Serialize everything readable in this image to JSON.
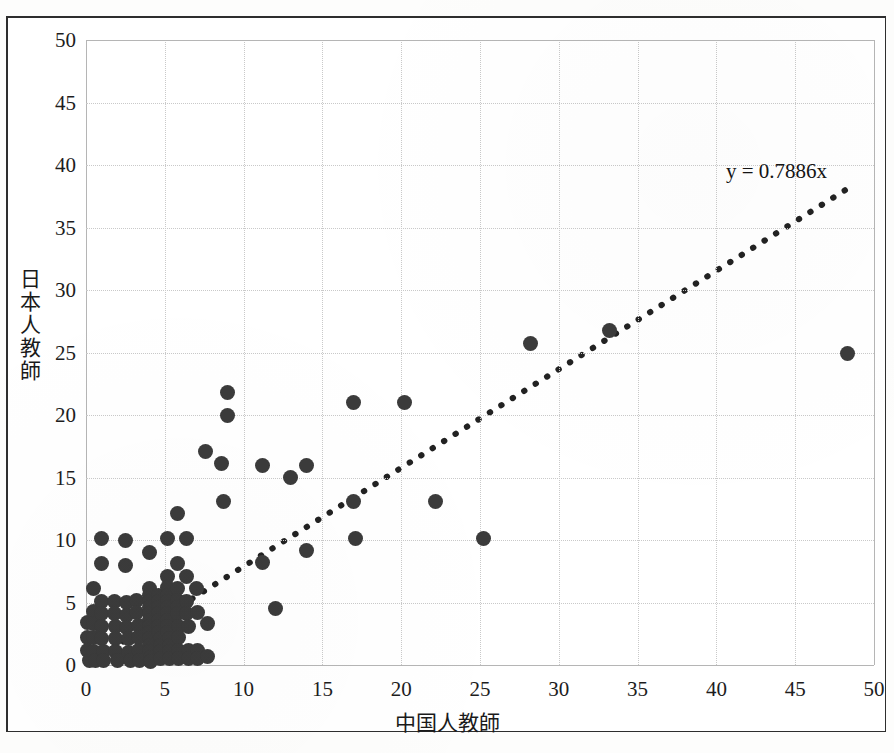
{
  "chart_data": {
    "type": "scatter",
    "title": "",
    "xlabel": "中国人教師",
    "ylabel": "日本人教師",
    "xlim": [
      0,
      50
    ],
    "ylim": [
      0,
      50
    ],
    "xticks": [
      0,
      5,
      10,
      15,
      20,
      25,
      30,
      35,
      40,
      45,
      50
    ],
    "yticks": [
      0,
      5,
      10,
      15,
      20,
      25,
      30,
      35,
      40,
      45,
      50
    ],
    "grid": true,
    "legend": null,
    "marker_color": "#3b3b3b",
    "annotations": [
      {
        "text": "y = 0.7886x",
        "x": 40.6,
        "y": 40.5,
        "name": "regression-equation"
      }
    ],
    "trendline": {
      "type": "linear-through-origin",
      "equation": "y = 0.7886x",
      "slope": 0.7886,
      "intercept": 0,
      "style": "dotted",
      "x_start": 0.2,
      "x_end": 48.5,
      "color": "#222222"
    },
    "points": [
      [
        0.1,
        3.4
      ],
      [
        0.1,
        2.2
      ],
      [
        0.1,
        1.2
      ],
      [
        0.2,
        0.4
      ],
      [
        0.5,
        6.1
      ],
      [
        0.5,
        4.3
      ],
      [
        0.5,
        3.3
      ],
      [
        0.5,
        2.2
      ],
      [
        0.5,
        1.1
      ],
      [
        0.6,
        0.4
      ],
      [
        1.0,
        10.1
      ],
      [
        1.0,
        8.1
      ],
      [
        1.0,
        5.1
      ],
      [
        1.0,
        4.1
      ],
      [
        1.0,
        3.1
      ],
      [
        1.0,
        2.1
      ],
      [
        1.1,
        1.1
      ],
      [
        1.1,
        0.4
      ],
      [
        1.8,
        5.1
      ],
      [
        1.8,
        4.1
      ],
      [
        1.9,
        3.1
      ],
      [
        1.9,
        2.1
      ],
      [
        1.9,
        1.1
      ],
      [
        2.0,
        0.4
      ],
      [
        2.5,
        10.0
      ],
      [
        2.5,
        8.0
      ],
      [
        2.6,
        5.0
      ],
      [
        2.6,
        4.0
      ],
      [
        2.6,
        3.0
      ],
      [
        2.7,
        2.1
      ],
      [
        2.7,
        1.0
      ],
      [
        2.8,
        0.4
      ],
      [
        3.2,
        5.2
      ],
      [
        3.2,
        4.2
      ],
      [
        3.3,
        3.2
      ],
      [
        3.3,
        2.2
      ],
      [
        3.3,
        1.2
      ],
      [
        3.4,
        0.4
      ],
      [
        4.0,
        9.0
      ],
      [
        4.0,
        6.1
      ],
      [
        4.0,
        5.6
      ],
      [
        4.0,
        5.1
      ],
      [
        4.0,
        4.6
      ],
      [
        4.0,
        4.1
      ],
      [
        4.0,
        3.6
      ],
      [
        4.0,
        3.1
      ],
      [
        4.0,
        2.6
      ],
      [
        4.0,
        2.1
      ],
      [
        4.0,
        1.6
      ],
      [
        4.0,
        1.1
      ],
      [
        4.1,
        0.6
      ],
      [
        4.1,
        0.3
      ],
      [
        4.6,
        5.6
      ],
      [
        4.6,
        5.1
      ],
      [
        4.6,
        4.6
      ],
      [
        4.6,
        4.1
      ],
      [
        4.6,
        3.6
      ],
      [
        4.6,
        3.1
      ],
      [
        4.6,
        2.6
      ],
      [
        4.7,
        2.1
      ],
      [
        4.7,
        1.6
      ],
      [
        4.7,
        1.1
      ],
      [
        4.7,
        0.5
      ],
      [
        5.2,
        10.1
      ],
      [
        5.2,
        7.1
      ],
      [
        5.2,
        6.2
      ],
      [
        5.2,
        5.6
      ],
      [
        5.2,
        5.1
      ],
      [
        5.2,
        4.6
      ],
      [
        5.2,
        4.1
      ],
      [
        5.2,
        3.6
      ],
      [
        5.2,
        3.1
      ],
      [
        5.2,
        2.6
      ],
      [
        5.3,
        2.1
      ],
      [
        5.3,
        1.6
      ],
      [
        5.3,
        1.1
      ],
      [
        5.3,
        0.5
      ],
      [
        5.8,
        12.1
      ],
      [
        5.8,
        8.1
      ],
      [
        5.8,
        6.1
      ],
      [
        5.8,
        5.2
      ],
      [
        5.8,
        4.6
      ],
      [
        5.8,
        4.1
      ],
      [
        5.9,
        3.1
      ],
      [
        5.9,
        2.2
      ],
      [
        5.9,
        1.2
      ],
      [
        5.9,
        0.5
      ],
      [
        6.4,
        10.1
      ],
      [
        6.4,
        7.1
      ],
      [
        6.4,
        5.1
      ],
      [
        6.4,
        4.1
      ],
      [
        6.5,
        3.1
      ],
      [
        6.5,
        1.2
      ],
      [
        6.5,
        0.5
      ],
      [
        7.0,
        6.1
      ],
      [
        7.1,
        4.2
      ],
      [
        7.1,
        1.2
      ],
      [
        7.1,
        0.5
      ],
      [
        7.6,
        17.1
      ],
      [
        7.7,
        3.3
      ],
      [
        7.7,
        0.7
      ],
      [
        8.6,
        16.1
      ],
      [
        8.7,
        13.1
      ],
      [
        9.0,
        21.8
      ],
      [
        9.0,
        20.0
      ],
      [
        11.2,
        16.0
      ],
      [
        11.2,
        8.2
      ],
      [
        12.0,
        4.5
      ],
      [
        13.0,
        15.0
      ],
      [
        14.0,
        16.0
      ],
      [
        14.0,
        9.2
      ],
      [
        17.0,
        21.0
      ],
      [
        17.0,
        13.1
      ],
      [
        17.1,
        10.1
      ],
      [
        20.2,
        21.0
      ],
      [
        22.2,
        13.1
      ],
      [
        25.2,
        10.1
      ],
      [
        28.2,
        25.7
      ],
      [
        33.2,
        26.8
      ],
      [
        48.3,
        24.9
      ]
    ]
  }
}
